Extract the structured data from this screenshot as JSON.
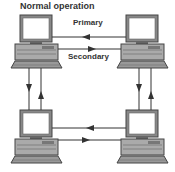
{
  "diagram": {
    "title": "Normal operation",
    "labels": {
      "primary": "Primary",
      "secondary": "Secondary"
    },
    "nodes": [
      {
        "id": "computer-top-left",
        "icon": "desktop-computer-icon"
      },
      {
        "id": "computer-top-right",
        "icon": "desktop-computer-icon"
      },
      {
        "id": "computer-bottom-left",
        "icon": "desktop-computer-icon"
      },
      {
        "id": "computer-bottom-right",
        "icon": "desktop-computer-icon"
      }
    ],
    "links": [
      {
        "from": "computer-top-right",
        "to": "computer-top-left",
        "label": "Primary"
      },
      {
        "from": "computer-top-left",
        "to": "computer-top-right",
        "label": "Secondary"
      },
      {
        "from": "computer-top-left",
        "to": "computer-bottom-left"
      },
      {
        "from": "computer-bottom-left",
        "to": "computer-top-left"
      },
      {
        "from": "computer-top-right",
        "to": "computer-bottom-right"
      },
      {
        "from": "computer-bottom-right",
        "to": "computer-top-right"
      },
      {
        "from": "computer-bottom-right",
        "to": "computer-bottom-left"
      },
      {
        "from": "computer-bottom-left",
        "to": "computer-bottom-right"
      }
    ]
  }
}
